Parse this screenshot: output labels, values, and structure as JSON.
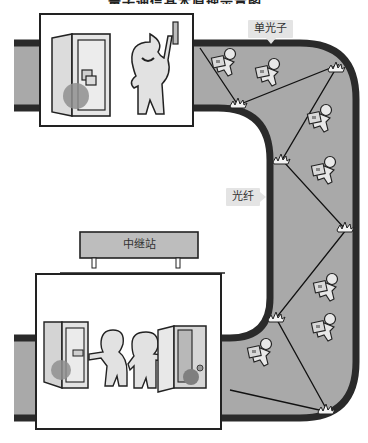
{
  "title": {
    "text": "量子通信基本原理示意图",
    "visibility": "cropped-at-top"
  },
  "labels": {
    "single_photon": "单光子",
    "optical_fiber": "光纤",
    "relay_station": "中继站"
  },
  "icons": {
    "sender_panel": [
      "safe-locked-icon",
      "person-holding-key-icon"
    ],
    "receiver_panel": [
      "safe-closed-icon",
      "person-handing-key-icon",
      "person-receiving-icon",
      "safe-open-icon"
    ],
    "fiber_travelers": "photon-figure-carrying-safe-icon",
    "reflection_points": "reflection-burst-icon"
  },
  "colors": {
    "fiber_fill": "#a9a9a9",
    "fiber_wall": "#2a2a2a",
    "panel_bg": "#ffffff",
    "figure_fill": "#e2e2e2",
    "safe_ball": "#8f8f8f",
    "callout_bg": "#e4e4e4",
    "relay_fill": "#bdbdbd"
  }
}
